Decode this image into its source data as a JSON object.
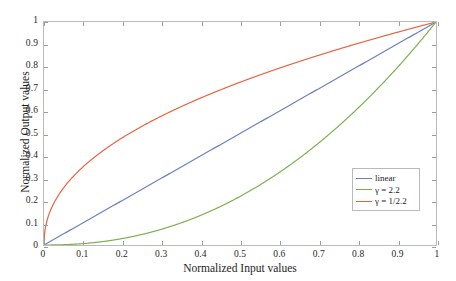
{
  "chart_data": {
    "type": "line",
    "title": "",
    "xlabel": "Normalized Input values",
    "ylabel": "Normalized Output values",
    "xlim": [
      0,
      1
    ],
    "ylim": [
      0,
      1
    ],
    "grid": false,
    "legend_position": "lower right",
    "xticks": [
      "0",
      "0.1",
      "0.2",
      "0.3",
      "0.4",
      "0.5",
      "0.6",
      "0.7",
      "0.8",
      "0.9",
      "1"
    ],
    "yticks": [
      "0",
      "0.1",
      "0.2",
      "0.3",
      "0.4",
      "0.5",
      "0.6",
      "0.7",
      "0.8",
      "0.9",
      "1"
    ],
    "x": [
      0,
      0.05,
      0.1,
      0.15,
      0.2,
      0.25,
      0.3,
      0.35,
      0.4,
      0.45,
      0.5,
      0.55,
      0.6,
      0.65,
      0.7,
      0.75,
      0.8,
      0.85,
      0.9,
      0.95,
      1
    ],
    "series": [
      {
        "name": "linear",
        "color": "#6a7fc0",
        "formula": "y = x",
        "values": [
          0,
          0.05,
          0.1,
          0.15,
          0.2,
          0.25,
          0.3,
          0.35,
          0.4,
          0.45,
          0.5,
          0.55,
          0.6,
          0.65,
          0.7,
          0.75,
          0.8,
          0.85,
          0.9,
          0.95,
          1
        ]
      },
      {
        "name": "γ = 2.2",
        "color": "#77b04a",
        "formula": "y = x^2.2",
        "values": [
          0,
          0.0017,
          0.0079,
          0.0189,
          0.0347,
          0.0552,
          0.0804,
          0.1104,
          0.1451,
          0.1845,
          0.2176,
          0.2765,
          0.3298,
          0.3876,
          0.4498,
          0.5165,
          0.5876,
          0.6632,
          0.7432,
          0.8277,
          1
        ]
      },
      {
        "name": "γ = 1/2.2",
        "color": "#e8603c",
        "formula": "y = x^(1/2.2)",
        "values": [
          0,
          0.2566,
          0.3509,
          0.4195,
          0.4758,
          0.5244,
          0.5677,
          0.607,
          0.6433,
          0.677,
          0.7087,
          0.7386,
          0.7669,
          0.7939,
          0.8198,
          0.8447,
          0.8686,
          0.8917,
          0.9141,
          0.9358,
          1
        ]
      }
    ]
  },
  "legend": {
    "items": [
      {
        "label": "linear"
      },
      {
        "label": "γ = 2.2"
      },
      {
        "label": "γ = 1/2.2"
      }
    ]
  }
}
